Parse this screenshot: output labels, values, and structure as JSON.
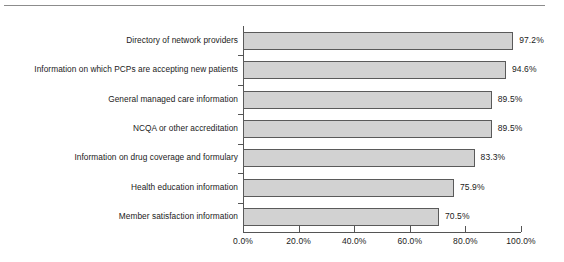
{
  "chart_data": {
    "type": "bar",
    "orientation": "horizontal",
    "title": "",
    "subtitle": "",
    "xlabel": "",
    "ylabel": "",
    "categories": [
      "Directory of network providers",
      "Information on which PCPs are accepting new patients",
      "General managed care information",
      "NCQA or other accreditation",
      "Information on drug coverage and formulary",
      "Health education information",
      "Member satisfaction information"
    ],
    "values": [
      97.2,
      94.6,
      89.5,
      89.5,
      83.3,
      75.9,
      70.5
    ],
    "value_labels": [
      "97.2%",
      "94.6%",
      "89.5%",
      "89.5%",
      "83.3%",
      "75.9%",
      "70.5%"
    ],
    "xlim": [
      0,
      100
    ],
    "xticks": [
      0,
      20,
      40,
      60,
      80,
      100
    ],
    "xtick_labels": [
      "0.0%",
      "20.0%",
      "40.0%",
      "60.0%",
      "80.0%",
      "100.0%"
    ],
    "grid": false,
    "legend": null,
    "bar_fill_color": "#d2d2d2",
    "bar_border_color": "#5a5a5a",
    "axis_color": "#555555",
    "rule_color": "#8c8c8c"
  }
}
